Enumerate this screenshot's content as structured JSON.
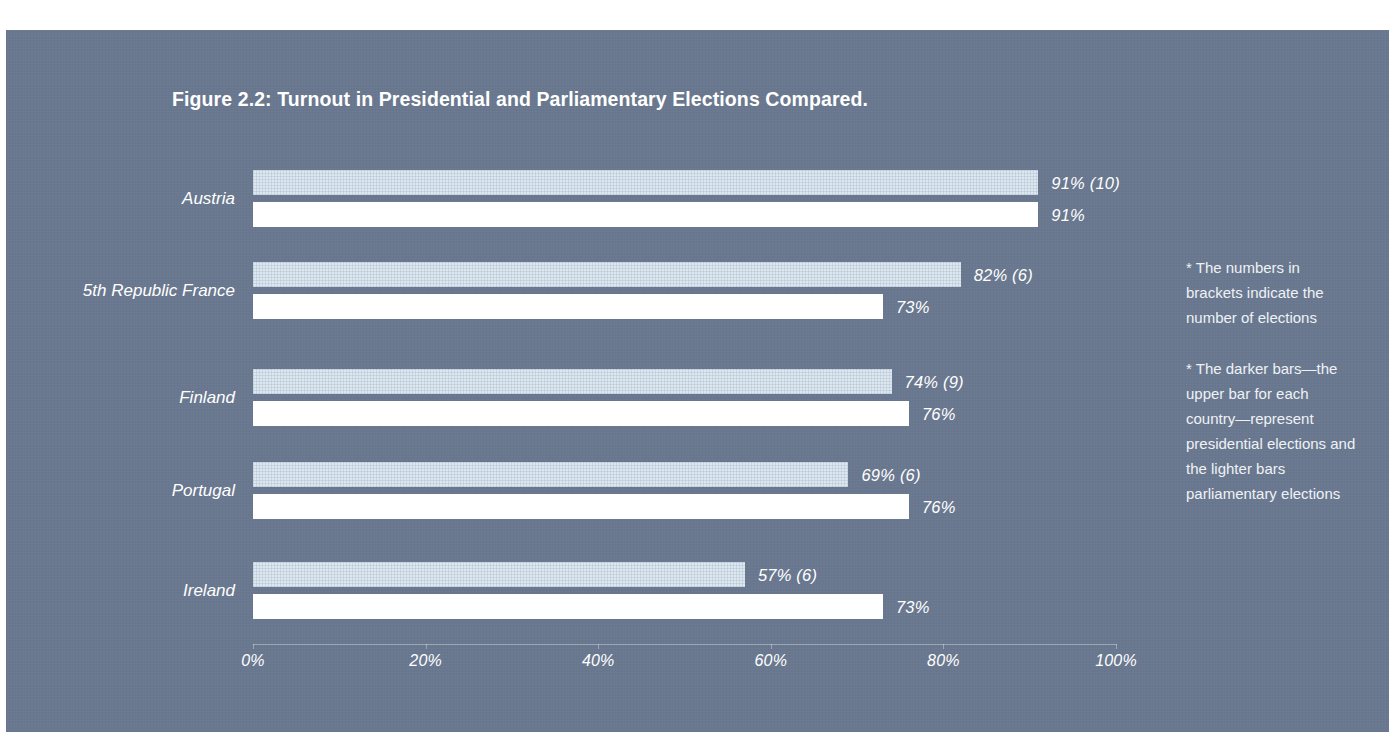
{
  "figure": {
    "title": "Figure 2.2: Turnout in Presidential and Parliamentary Elections Compared.",
    "notes": [
      "* The numbers in brackets indicate the number of elections",
      "* The darker bars—the upper bar for each country—represent presidential elections and the lighter bars parliamentary elections"
    ]
  },
  "colors": {
    "panel_background": "#69788f",
    "presidential_bar": "#dde7ef",
    "parliamentary_bar": "#ffffff",
    "text": "#ffffff"
  },
  "chart_data": {
    "type": "bar",
    "title": "Figure 2.2: Turnout in Presidential and Parliamentary Elections Compared.",
    "orientation": "horizontal",
    "xlabel": "",
    "ylabel": "",
    "xlim": [
      0,
      100
    ],
    "grid": false,
    "legend": "none",
    "tick_labels": [
      "0%",
      "20%",
      "40%",
      "60%",
      "80%",
      "100%"
    ],
    "ticks": [
      0,
      20,
      40,
      60,
      80,
      100
    ],
    "categories": [
      "Austria",
      "5th Republic France",
      "Finland",
      "Portugal",
      "Ireland"
    ],
    "series": [
      {
        "name": "Presidential",
        "values": [
          91,
          82,
          74,
          69,
          57
        ],
        "elections": [
          10,
          6,
          9,
          6,
          6
        ],
        "labels": [
          "91% (10)",
          "82% (6)",
          "74% (9)",
          "69% (6)",
          "57% (6)"
        ]
      },
      {
        "name": "Parliamentary",
        "values": [
          91,
          73,
          76,
          76,
          73
        ],
        "labels": [
          "91%",
          "73%",
          "76%",
          "76%",
          "73%"
        ]
      }
    ]
  }
}
